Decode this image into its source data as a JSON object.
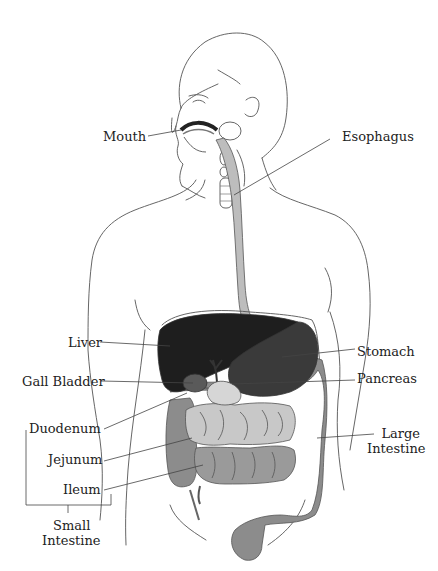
{
  "diagram": {
    "colors": {
      "liver": "#1e1e1e",
      "stomach": "#3a3a3a",
      "gall_bladder": "#5a5a5a",
      "large_intestine": "#8c8c8c",
      "small_intestine_ileum": "#9a9a9a",
      "small_intestine_jejunum": "#c8c8c8",
      "esophagus": "#bdbdbd",
      "pancreas": "#d6d6d6",
      "outline": "#555555"
    },
    "labels": {
      "mouth": "Mouth",
      "esophagus": "Esophagus",
      "liver": "Liver",
      "stomach": "Stomach",
      "gall_bladder": "Gall Bladder",
      "pancreas": "Pancreas",
      "duodenum": "Duodenum",
      "large_intestine_line1": "Large",
      "large_intestine_line2": "Intestine",
      "jejunum": "Jejunum",
      "ileum": "Ileum",
      "small_intestine_line1": "Small",
      "small_intestine_line2": "Intestine"
    }
  }
}
